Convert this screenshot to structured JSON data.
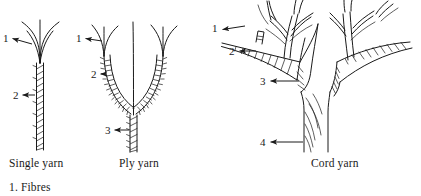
{
  "figure": {
    "kind": "yarn-structure-diagram",
    "background_color": "#ffffff",
    "ink_color": "#1a1a1a"
  },
  "panels": [
    {
      "id": "single-yarn",
      "caption": "Single yarn",
      "callouts": [
        {
          "number": "1",
          "target": "fibres"
        },
        {
          "number": "2",
          "target": "single-yarn-twist"
        }
      ]
    },
    {
      "id": "ply-yarn",
      "caption": "Ply yarn",
      "callouts": [
        {
          "number": "1",
          "target": "fibres"
        },
        {
          "number": "2",
          "target": "single-yarn-twist"
        },
        {
          "number": "3",
          "target": "ply-twist"
        }
      ]
    },
    {
      "id": "cord-yarn",
      "caption": "Cord yarn",
      "callouts": [
        {
          "number": "1",
          "target": "fibres"
        },
        {
          "number": "2",
          "target": "single-yarn-twist"
        },
        {
          "number": "3",
          "target": "ply-twist"
        },
        {
          "number": "4",
          "target": "cord-twist"
        }
      ]
    }
  ],
  "captions": {
    "single": "Single yarn",
    "ply": "Ply yarn",
    "cord": "Cord yarn"
  },
  "callout_numbers": {
    "single_1": "1",
    "single_2": "2",
    "ply_1": "1",
    "ply_2": "2",
    "ply_3": "3",
    "cord_1": "1",
    "cord_2": "2",
    "cord_3": "3",
    "cord_4": "4"
  },
  "legend": {
    "line_1": "1. Fibres"
  }
}
